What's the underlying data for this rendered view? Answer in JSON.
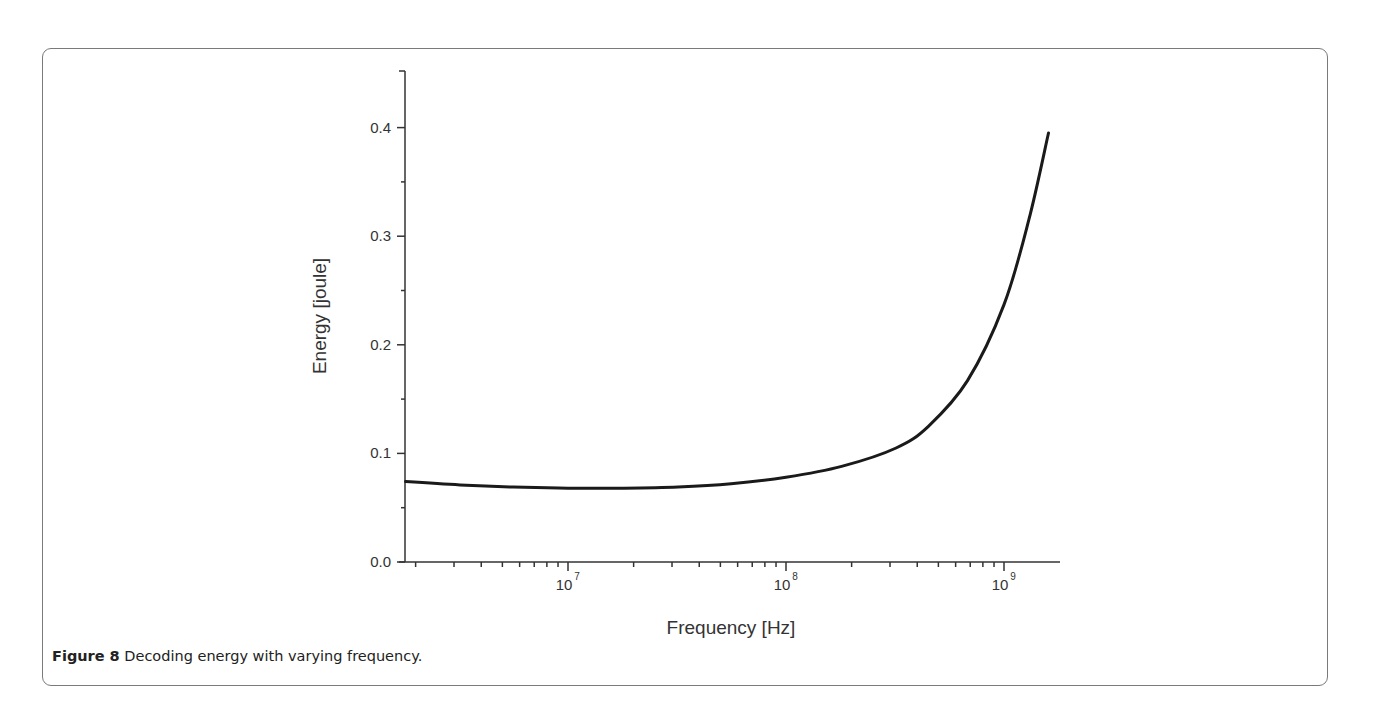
{
  "figure": {
    "caption_label": "Figure 8",
    "caption_text": " Decoding energy with varying frequency."
  },
  "chart_data": {
    "type": "line",
    "title": "",
    "xlabel": "Frequency [Hz]",
    "ylabel": "Energy [joule]",
    "xscale": "log",
    "xlim": [
      1800000.0,
      1800000000.0
    ],
    "ylim": [
      0.0,
      0.45
    ],
    "grid": false,
    "legend": null,
    "x_ticks": [
      {
        "value": 10000000.0,
        "label_base": "10",
        "label_exp": "7"
      },
      {
        "value": 100000000.0,
        "label_base": "10",
        "label_exp": "8"
      },
      {
        "value": 1000000000.0,
        "label_base": "10",
        "label_exp": "9"
      }
    ],
    "y_ticks": [
      {
        "value": 0.0,
        "label": "0.0"
      },
      {
        "value": 0.1,
        "label": "0.1"
      },
      {
        "value": 0.2,
        "label": "0.2"
      },
      {
        "value": 0.3,
        "label": "0.3"
      },
      {
        "value": 0.4,
        "label": "0.4"
      }
    ],
    "series": [
      {
        "name": "Decoding energy",
        "color": "#1a1a1a",
        "x": [
          1800000.0,
          3200000.0,
          5600000.0,
          10000000.0,
          18000000.0,
          32000000.0,
          56000000.0,
          100000000.0,
          180000000.0,
          320000000.0,
          450000000.0,
          680000000.0,
          1000000000.0,
          1300000000.0,
          1600000000.0
        ],
        "y": [
          0.074,
          0.071,
          0.069,
          0.068,
          0.068,
          0.069,
          0.072,
          0.078,
          0.088,
          0.105,
          0.125,
          0.167,
          0.237,
          0.315,
          0.395
        ]
      }
    ]
  }
}
